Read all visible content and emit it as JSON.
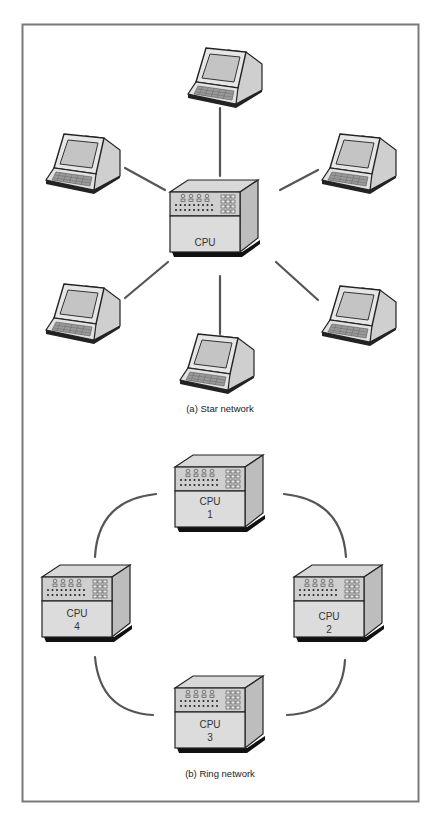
{
  "figure": {
    "frame_color": "#7a7a7a",
    "line_color": "#555555",
    "panels": [
      {
        "id": "a",
        "caption": "(a)  Star network",
        "topology": "star",
        "center": {
          "type": "cpu",
          "label": "CPU"
        },
        "nodes": [
          {
            "type": "terminal",
            "position": "top"
          },
          {
            "type": "terminal",
            "position": "upper-left"
          },
          {
            "type": "terminal",
            "position": "upper-right"
          },
          {
            "type": "terminal",
            "position": "lower-left"
          },
          {
            "type": "terminal",
            "position": "lower-right"
          },
          {
            "type": "terminal",
            "position": "bottom"
          }
        ]
      },
      {
        "id": "b",
        "caption": "(b)  Ring network",
        "topology": "ring",
        "nodes": [
          {
            "type": "cpu",
            "label": "CPU",
            "number": "1",
            "position": "top"
          },
          {
            "type": "cpu",
            "label": "CPU",
            "number": "2",
            "position": "right"
          },
          {
            "type": "cpu",
            "label": "CPU",
            "number": "3",
            "position": "bottom"
          },
          {
            "type": "cpu",
            "label": "CPU",
            "number": "4",
            "position": "left"
          }
        ],
        "links": [
          [
            "1",
            "2"
          ],
          [
            "2",
            "3"
          ],
          [
            "3",
            "4"
          ],
          [
            "4",
            "1"
          ]
        ]
      }
    ]
  }
}
